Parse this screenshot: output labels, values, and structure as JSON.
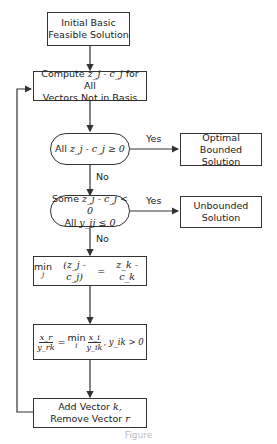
{
  "diagram": {
    "type": "flowchart",
    "nodes": [
      {
        "id": "start",
        "shape": "rect",
        "lines": [
          "Initial Basic",
          "Feasible Solution"
        ]
      },
      {
        "id": "compute",
        "shape": "rect",
        "lines": [
          "Compute z_j - c_j for All",
          "Vectors Not in Basis"
        ],
        "line1_prefix": "Compute",
        "line1_suffix": "for All",
        "line2": "Vectors Not in Basis",
        "math": "z_j - c_j"
      },
      {
        "id": "test_optimal",
        "shape": "rounded",
        "lines": [
          "All z_j - c_j ≥ 0"
        ],
        "prefix": "All",
        "math": "z_j - c_j ≥ 0"
      },
      {
        "id": "optimal",
        "shape": "rect",
        "lines": [
          "Optimal Bounded",
          "Solution"
        ]
      },
      {
        "id": "test_unbounded",
        "shape": "rounded",
        "lines": [
          "Some z_j - c_j < 0",
          "All y_ij ≤ 0"
        ],
        "line1_prefix": "Some",
        "line1_math": "z_j - c_j < 0",
        "line2_prefix": "All",
        "line2_math": "y_ij ≤ 0"
      },
      {
        "id": "unbounded",
        "shape": "rect",
        "lines": [
          "Unbounded",
          "Solution"
        ]
      },
      {
        "id": "entering",
        "shape": "rect",
        "lines": [
          "min_j (z_j - c_j) = z_k - c_k"
        ],
        "min_word": "min",
        "min_sub": "j",
        "lhs": "(z_j - c_j)",
        "eq": "=",
        "rhs": "z_k - c_k"
      },
      {
        "id": "ratio",
        "shape": "rect",
        "lines": [
          "x_r / y_rk = min_i x_i / y_ik , y_ik > 0"
        ],
        "frac1_top": "x_r",
        "frac1_bot": "y_rk",
        "eq": "=",
        "min_word": "min",
        "min_sub": "i",
        "frac2_top": "x_i",
        "frac2_bot": "y_ik",
        "cond": ", y_ik > 0"
      },
      {
        "id": "pivot",
        "shape": "rect",
        "lines": [
          "Add Vector k,",
          "Remove Vector r"
        ],
        "line1_prefix": "Add Vector",
        "line1_var": "k,",
        "line2_prefix": "Remove Vector",
        "line2_var": "r"
      }
    ],
    "edges": [
      {
        "from": "start",
        "to": "compute",
        "label": ""
      },
      {
        "from": "compute",
        "to": "test_optimal",
        "label": ""
      },
      {
        "from": "test_optimal",
        "to": "optimal",
        "label": "Yes"
      },
      {
        "from": "test_optimal",
        "to": "test_unbounded",
        "label": "No"
      },
      {
        "from": "test_unbounded",
        "to": "unbounded",
        "label": "Yes"
      },
      {
        "from": "test_unbounded",
        "to": "entering",
        "label": "No"
      },
      {
        "from": "entering",
        "to": "ratio",
        "label": ""
      },
      {
        "from": "ratio",
        "to": "pivot",
        "label": ""
      },
      {
        "from": "pivot",
        "to": "compute",
        "label": "",
        "route": "loop-left"
      }
    ],
    "labels": {
      "yes": "Yes",
      "no": "No"
    },
    "caption": "Figure"
  }
}
